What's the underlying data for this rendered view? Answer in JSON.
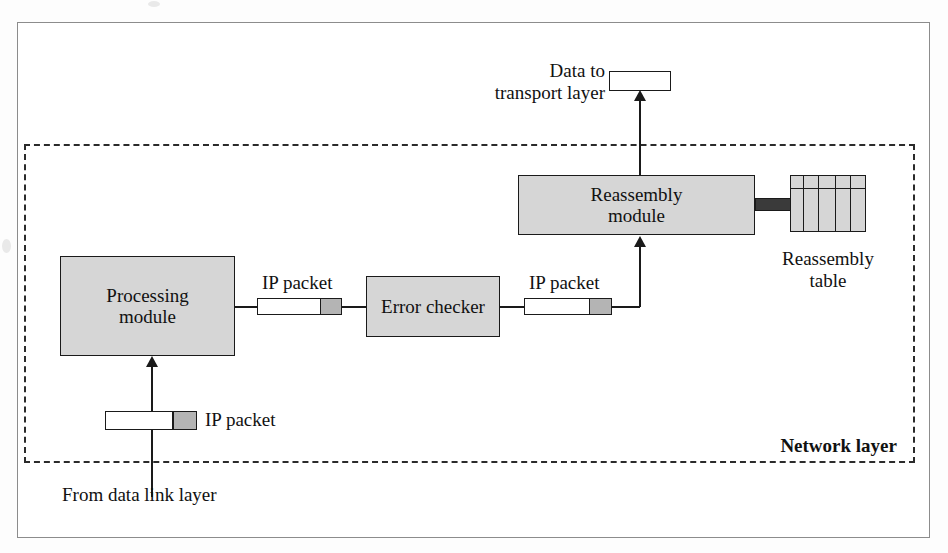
{
  "diagram": {
    "layer_label": "Network layer",
    "modules": [
      {
        "id": "processing",
        "label_line1": "Processing",
        "label_line2": "module"
      },
      {
        "id": "error_checker",
        "label_line1": "Error checker",
        "label_line2": ""
      },
      {
        "id": "reassembly",
        "label_line1": "Reassembly",
        "label_line2": "module"
      }
    ],
    "table": {
      "label_line1": "Reassembly",
      "label_line2": "table",
      "columns": 5,
      "has_header_row": true
    },
    "packets": {
      "input_label": "IP packet",
      "middle_label": "IP packet",
      "output_label": "IP packet"
    },
    "endpoints": {
      "top_line1": "Data to",
      "top_line2": "transport layer",
      "bottom": "From data link layer"
    },
    "colors": {
      "module_fill": "#d6d6d6",
      "packet_header_fill": "#b4b4b4",
      "packet_body_fill": "#ffffff",
      "stroke": "#1a1a1a",
      "thick_connector": "#3a3a3a",
      "frame": "#8c8c8c"
    }
  }
}
